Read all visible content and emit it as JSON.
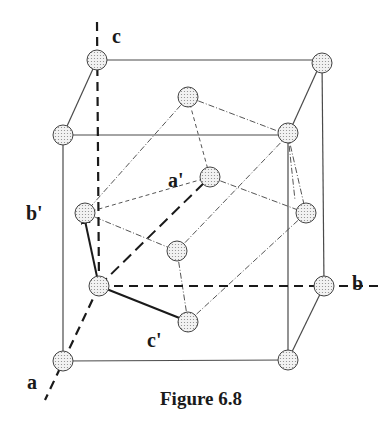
{
  "figure": {
    "caption": "Figure 6.8",
    "axis_labels": {
      "a": "a",
      "b": "b",
      "c": "c"
    },
    "primed_labels": {
      "a_prime": "a'",
      "b_prime": "b'",
      "c_prime": "c'"
    },
    "colors": {
      "line": "#3a3a3a",
      "atom_fill": "#e6e6e6",
      "atom_stroke": "#444444",
      "arrow": "#1a1a1a"
    }
  }
}
